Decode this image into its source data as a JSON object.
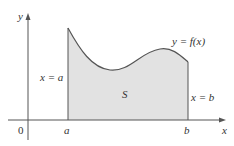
{
  "diagram": {
    "axes": {
      "x_label": "x",
      "y_label": "y",
      "origin_label": "0"
    },
    "tick_labels": {
      "a": "a",
      "b": "b"
    },
    "curve_label": "y = f(x)",
    "region_label": "S",
    "left_bound_label": "x = a",
    "right_bound_label": "x = b",
    "colors": {
      "fill": "#e2e2e2",
      "stroke": "#555555",
      "axis": "#555555"
    }
  }
}
